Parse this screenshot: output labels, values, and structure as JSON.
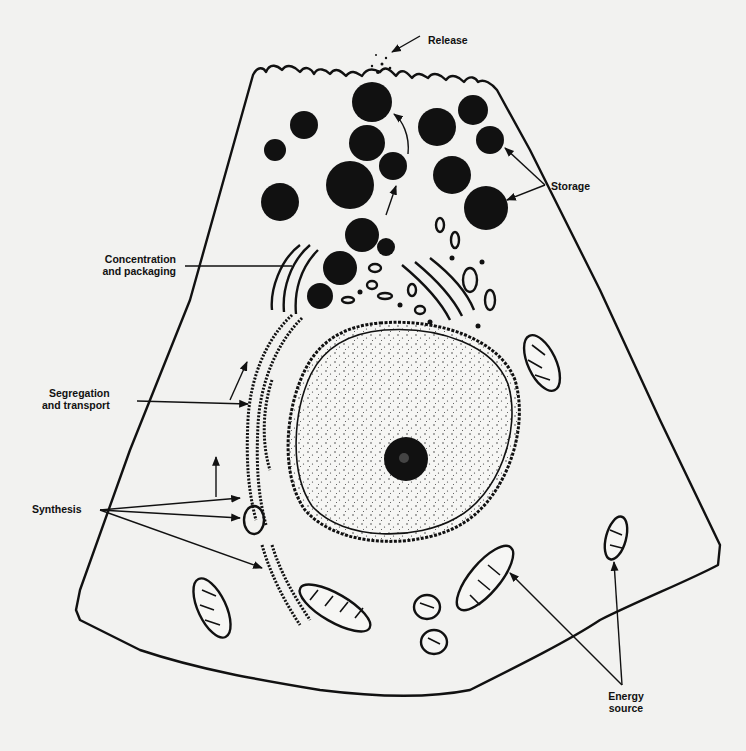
{
  "figure": {
    "labels": {
      "release": "Release",
      "storage": "Storage",
      "concentration_line1": "Concentration",
      "concentration_line2": "and packaging",
      "segregation_line1": "Segregation",
      "segregation_line2": "and transport",
      "synthesis": "Synthesis",
      "energy_line1": "Energy",
      "energy_line2": "source"
    },
    "colors": {
      "paper": "#f2f2f0",
      "ink": "#111111"
    }
  }
}
